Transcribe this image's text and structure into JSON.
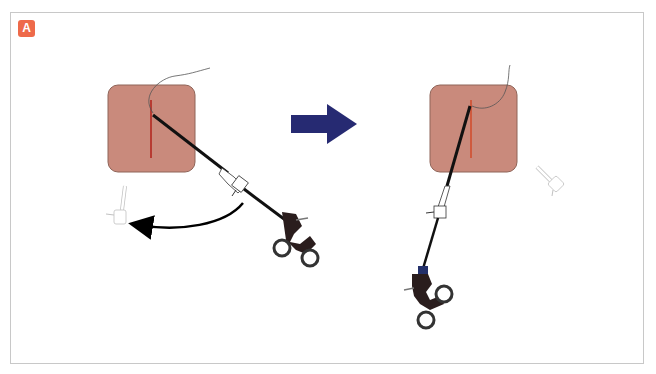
{
  "figure": {
    "panel_label": "A",
    "colors": {
      "badge": "#ee6a4a",
      "tissue_pad": "#c98a7c",
      "tissue_pad_border": "#8f6458",
      "incision": "#b0201a",
      "arrow_transition": "#262a72",
      "instrument_shaft": "#111111",
      "handle": "#2a1d1d",
      "suture": "#555555"
    }
  },
  "scenes": [
    {
      "id": "before",
      "tissue_pad": {
        "x": 108,
        "y": 85,
        "w": 87,
        "h": 87
      },
      "incision": {
        "x": 151,
        "y1": 100,
        "y2": 158
      },
      "needle_holder": {
        "tip": [
          153,
          115
        ],
        "angle_deg": 37
      },
      "ghost_instrument": {
        "x": 118,
        "y": 210
      },
      "rotation_arrow": "counterclockwise-curve"
    },
    {
      "id": "after",
      "tissue_pad": {
        "x": 430,
        "y": 85,
        "w": 87,
        "h": 87
      },
      "incision": {
        "x": 471,
        "y1": 100,
        "y2": 158
      },
      "needle_holder": {
        "tip": [
          470,
          106
        ],
        "angle_deg": 110
      },
      "ghost_instrument": {
        "x": 552,
        "y": 178
      }
    }
  ],
  "transition_arrow": {
    "direction": "right"
  }
}
